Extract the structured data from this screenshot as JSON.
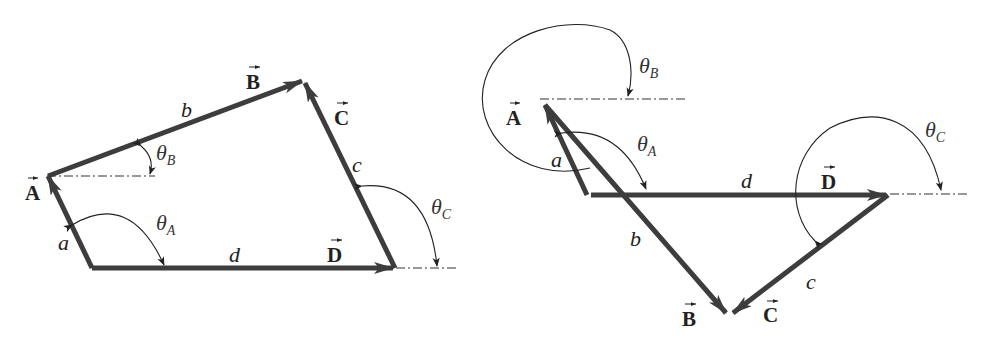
{
  "figures": [
    {
      "id": "left",
      "description": "Four-bar linkage vector loop (open configuration)",
      "vectors": {
        "A": {
          "label": "A",
          "magnitude_label": "a",
          "angle_label": "θ",
          "angle_sub": "A"
        },
        "B": {
          "label": "B",
          "magnitude_label": "b",
          "angle_label": "θ",
          "angle_sub": "B"
        },
        "C": {
          "label": "C",
          "magnitude_label": "c",
          "angle_label": "θ",
          "angle_sub": "C"
        },
        "D": {
          "label": "D",
          "magnitude_label": "d"
        }
      }
    },
    {
      "id": "right",
      "description": "Four-bar linkage vector loop (crossed configuration)",
      "vectors": {
        "A": {
          "label": "A",
          "magnitude_label": "a",
          "angle_label": "θ",
          "angle_sub": "A"
        },
        "B": {
          "label": "B",
          "magnitude_label": "b",
          "angle_label": "θ",
          "angle_sub": "B"
        },
        "C": {
          "label": "C",
          "magnitude_label": "c",
          "angle_label": "θ",
          "angle_sub": "C"
        },
        "D": {
          "label": "D",
          "magnitude_label": "d"
        }
      }
    }
  ],
  "colors": {
    "vector": "#3d3d3d",
    "annotation": "#222222",
    "background": "#ffffff"
  }
}
